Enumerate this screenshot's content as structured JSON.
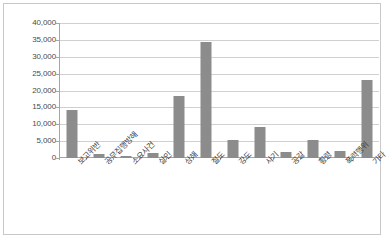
{
  "chart_data": {
    "type": "bar",
    "title": "",
    "subtitle": "",
    "xlabel": "",
    "ylabel": "",
    "ylim": [
      0,
      40000
    ],
    "ytick_step": 5000,
    "grid": true,
    "legend": false,
    "bar_color": "#8c8c8c",
    "gridline_color": "#d0d0d0",
    "axis_color": "#a6a6a6",
    "categories": [
      "보고위반",
      "공무집행방해",
      "소요사건",
      "살인",
      "상해",
      "절도",
      "강도",
      "사기",
      "공갈",
      "횡령",
      "폭력행위",
      "기타"
    ],
    "values": [
      14300,
      1300,
      700,
      1500,
      18500,
      34500,
      5200,
      9100,
      1900,
      5400,
      2100,
      23000
    ],
    "ytick_labels": [
      "40,000",
      "35,000",
      "30,000",
      "25,000",
      "20,000",
      "15,000",
      "10,000",
      "5,000",
      "0"
    ],
    "ytick_values": [
      40000,
      35000,
      30000,
      25000,
      20000,
      15000,
      10000,
      5000,
      0
    ]
  }
}
